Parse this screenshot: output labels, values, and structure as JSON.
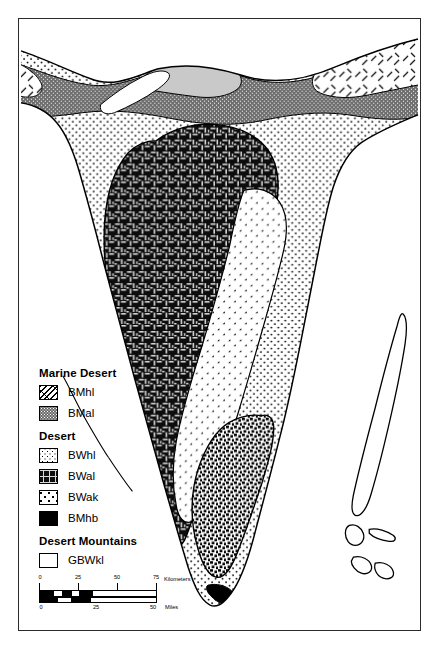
{
  "map": {
    "title": "Baja California Peninsula Desert Classification Map",
    "background_color": "#ffffff",
    "frame_color": "#2b2b2b",
    "outline_color": "#000000"
  },
  "legend": {
    "groups": [
      {
        "heading": "Marine Desert",
        "items": [
          {
            "code": "BMhl",
            "pattern": "diagonal-hatch",
            "fill": "#ffffff",
            "ink": "#000000"
          },
          {
            "code": "BMal",
            "pattern": "dense-dot-gray",
            "fill": "#6e6e6e",
            "ink": "#000000"
          }
        ]
      },
      {
        "heading": "Desert",
        "items": [
          {
            "code": "BWhl",
            "pattern": "fine-dot",
            "fill": "#ffffff",
            "ink": "#000000"
          },
          {
            "code": "BWal",
            "pattern": "basket-weave",
            "fill": "#101010",
            "ink": "#ffffff"
          },
          {
            "code": "BWak",
            "pattern": "sparse-arrow",
            "fill": "#ffffff",
            "ink": "#000000"
          },
          {
            "code": "BMhb",
            "pattern": "solid-black",
            "fill": "#000000",
            "ink": "#000000"
          }
        ]
      },
      {
        "heading": "Desert Mountains",
        "items": [
          {
            "code": "GBWkl",
            "pattern": "dense-checker",
            "fill": "#ffffff",
            "ink": "#000000"
          }
        ]
      }
    ]
  },
  "scalebar": {
    "kilometers": {
      "unit_label": "Kilometers",
      "ticks": [
        "0",
        "25",
        "50",
        "75"
      ]
    },
    "miles": {
      "unit_label": "Miles",
      "ticks": [
        "0",
        "25",
        "50"
      ]
    }
  }
}
